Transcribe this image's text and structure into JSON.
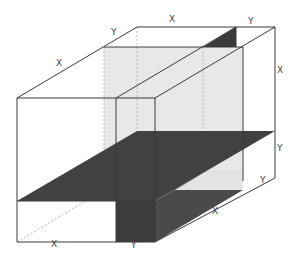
{
  "diagram": {
    "type": "3D box dissection with cutting planes",
    "labels": {
      "top_left_edge": "X",
      "top_left_edge_depth": "Y",
      "back_top_edge": "X",
      "back_top_depth": "Y",
      "right_vertical_upper": "X",
      "right_vertical_lower": "Y",
      "bottom_right_depth": "Y",
      "bottom_right_edge": "X",
      "front_bottom_left": "X",
      "front_bottom_right": "Y"
    },
    "colors": {
      "line": "#3a3a3a",
      "dark_plane": "#3f3f3f",
      "grey_panel": "#e6e6e6",
      "background": "#ffffff"
    }
  }
}
